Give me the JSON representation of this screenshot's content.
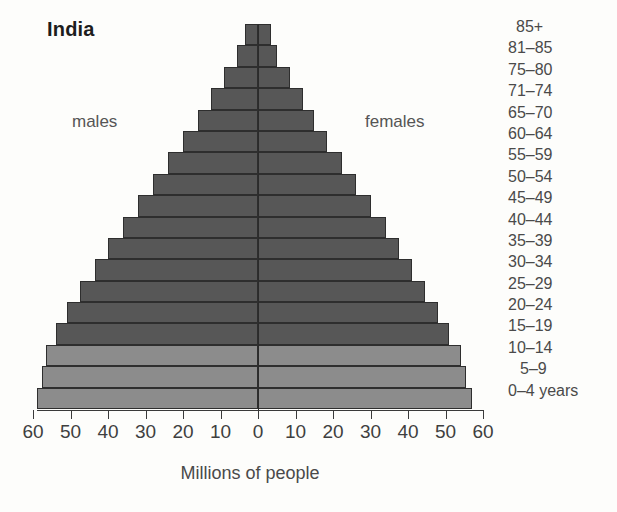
{
  "title": "India",
  "annotations": {
    "males": "males",
    "females": "females"
  },
  "axis": {
    "xlabel": "Millions of people",
    "tick_labels": [
      "60",
      "50",
      "40",
      "30",
      "20",
      "10",
      "0",
      "10",
      "20",
      "30",
      "40",
      "50",
      "60"
    ],
    "tick_values": [
      -60,
      -50,
      -40,
      -30,
      -20,
      -10,
      0,
      10,
      20,
      30,
      40,
      50,
      60
    ]
  },
  "chart_data": {
    "type": "bar",
    "subtype": "population-pyramid",
    "title": "India",
    "xlabel": "Millions of people",
    "ylabel": "",
    "xlim": [
      -60,
      60
    ],
    "grid": false,
    "legend": [
      "males",
      "females"
    ],
    "legend_position": "inside-top",
    "unit": "millions",
    "categories": [
      "85+",
      "81–85",
      "75–80",
      "71–74",
      "65–70",
      "60–64",
      "55–59",
      "50–54",
      "45–49",
      "40–44",
      "35–39",
      "30–34",
      "25–29",
      "20–24",
      "15–19",
      "10–14",
      "5–9",
      "0–4 years"
    ],
    "series": [
      {
        "name": "males",
        "side": "left",
        "color": "#575757",
        "values": [
          3.5,
          5.5,
          9.0,
          12.5,
          16.0,
          20.0,
          24.0,
          28.0,
          32.0,
          36.0,
          40.0,
          43.5,
          47.5,
          51.0,
          54.0,
          56.5,
          57.5,
          59.0
        ]
      },
      {
        "name": "females",
        "side": "right",
        "color": "#575757",
        "values": [
          3.5,
          5.0,
          8.5,
          12.0,
          15.0,
          18.5,
          22.5,
          26.0,
          30.0,
          34.0,
          37.5,
          41.0,
          44.5,
          48.0,
          51.0,
          54.0,
          55.5,
          57.0
        ]
      }
    ],
    "bar_shading": {
      "dark_color": "#575757",
      "light_color": "#8c8c8c",
      "light_categories": [
        "10–14",
        "5–9",
        "0–4 years"
      ]
    }
  }
}
